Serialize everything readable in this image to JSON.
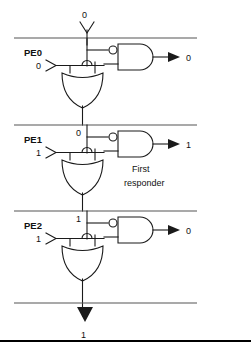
{
  "diagram": {
    "top_input_label": "0",
    "bottom_output_label": "1",
    "annotation": {
      "line1": "First",
      "line2": "responder"
    },
    "colors": {
      "wire": "#1a1a1a",
      "divider": "#555555",
      "frame": "#000000",
      "background": "#ffffff"
    },
    "stages": [
      {
        "name": "PE0",
        "chain_in_label": "0",
        "request_label": "0",
        "grant_label": "0"
      },
      {
        "name": "PE1",
        "chain_in_label": "0",
        "request_label": "1",
        "grant_label": "1"
      },
      {
        "name": "PE2",
        "chain_in_label": "1",
        "request_label": "1",
        "grant_label": "0"
      }
    ],
    "icons": {
      "and_gate": "and-gate-icon",
      "or_gate": "or-gate-icon",
      "inverter_bubble": "inverter-bubble-icon",
      "input_marker": "input-port-icon",
      "arrow": "arrow-icon"
    }
  }
}
